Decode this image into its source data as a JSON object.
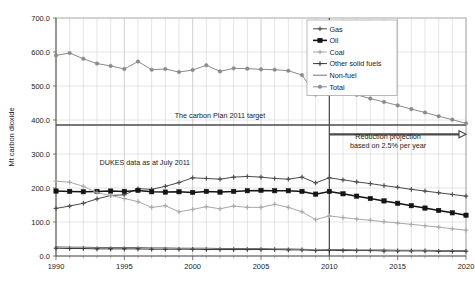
{
  "chart_data": {
    "type": "line",
    "title": "",
    "xlabel": "",
    "ylabel": "Mt carbon dioxide",
    "xlim": [
      1990,
      2020
    ],
    "ylim": [
      0,
      700
    ],
    "ytick_labels": [
      "0.0",
      "100.0",
      "200.0",
      "300.0",
      "400.0",
      "500.0",
      "600.0",
      "700.0"
    ],
    "ytick_values": [
      0,
      100,
      200,
      300,
      400,
      500,
      600,
      700
    ],
    "xtick_labels": [
      "1990",
      "1995",
      "2000",
      "2005",
      "2010",
      "2015",
      "2020"
    ],
    "xtick_values": [
      1990,
      1995,
      2000,
      2005,
      2010,
      2015,
      2020
    ],
    "grid": true,
    "legend_position": "top-right",
    "x": [
      1990,
      1991,
      1992,
      1993,
      1994,
      1995,
      1996,
      1997,
      1998,
      1999,
      2000,
      2001,
      2002,
      2003,
      2004,
      2005,
      2006,
      2007,
      2008,
      2009,
      2010,
      2011,
      2012,
      2013,
      2014,
      2015,
      2016,
      2017,
      2018,
      2019,
      2020
    ],
    "series": [
      {
        "name": "Gas",
        "color": "#4a4a4a",
        "marker": "cross",
        "values": [
          140,
          147,
          155,
          168,
          178,
          180,
          198,
          196,
          205,
          216,
          230,
          228,
          226,
          232,
          234,
          232,
          228,
          226,
          232,
          215,
          230,
          224,
          218,
          213,
          207,
          202,
          196,
          191,
          186,
          181,
          176
        ]
      },
      {
        "name": "Oil",
        "color": "#141414",
        "marker": "square",
        "values": [
          191,
          190,
          189,
          190,
          191,
          190,
          193,
          189,
          188,
          189,
          187,
          190,
          188,
          190,
          192,
          193,
          192,
          192,
          190,
          182,
          190,
          183,
          176,
          169,
          162,
          155,
          148,
          141,
          134,
          127,
          120
        ]
      },
      {
        "name": "Coal",
        "color": "#a8a8a8",
        "marker": "cross",
        "values": [
          220,
          217,
          205,
          186,
          178,
          169,
          160,
          143,
          148,
          130,
          137,
          145,
          139,
          147,
          143,
          143,
          152,
          143,
          130,
          107,
          118,
          113,
          109,
          105,
          101,
          97,
          93,
          89,
          85,
          80,
          76
        ]
      },
      {
        "name": "Other solid fuels",
        "color": "#383838",
        "marker": "cross",
        "values": [
          23,
          22,
          22,
          21,
          21,
          21,
          21,
          20,
          20,
          20,
          20,
          19,
          19,
          19,
          19,
          19,
          19,
          18,
          18,
          16,
          17,
          16,
          16,
          16,
          15,
          15,
          15,
          15,
          14,
          14,
          14
        ]
      },
      {
        "name": "Non-fuel",
        "color": "#707070",
        "marker": "none",
        "values": [
          27,
          26,
          26,
          25,
          25,
          25,
          25,
          24,
          24,
          23,
          23,
          23,
          22,
          22,
          22,
          22,
          21,
          21,
          20,
          18,
          19,
          19,
          18,
          18,
          18,
          17,
          17,
          17,
          16,
          16,
          16
        ]
      },
      {
        "name": "Total",
        "color": "#8a8a8a",
        "marker": "diamond",
        "values": [
          590,
          597,
          580,
          566,
          559,
          550,
          572,
          548,
          550,
          541,
          547,
          561,
          543,
          552,
          551,
          549,
          548,
          545,
          532,
          475,
          495,
          484,
          474,
          463,
          453,
          443,
          432,
          422,
          411,
          401,
          390
        ]
      }
    ],
    "annotations": [
      {
        "name": "carbon-plan-target",
        "text": "The carbon Plan 2011 target",
        "x": 2002.0,
        "y": 405
      },
      {
        "name": "dukes-data-note",
        "text": "DUKES data as at July 2011",
        "x": 1996.5,
        "y": 268
      },
      {
        "name": "reduction-projection-line1",
        "text": "Reduction projection",
        "x": 2014.3,
        "y": 343
      },
      {
        "name": "reduction-projection-line2",
        "text": "based on 2.5% per year",
        "x": 2014.3,
        "y": 318
      }
    ],
    "reference_lines": [
      {
        "name": "target-level-line",
        "orientation": "horizontal",
        "value": 385,
        "color": "#4a4a4a"
      },
      {
        "name": "projection-start-line",
        "orientation": "vertical",
        "value": 2010,
        "color": "#4a4a4a"
      }
    ],
    "arrows": [
      {
        "name": "reduction-projection-arrow",
        "x_start": 2010,
        "x_end": 2020,
        "y": 358,
        "color": "#4a4a4a"
      }
    ]
  }
}
